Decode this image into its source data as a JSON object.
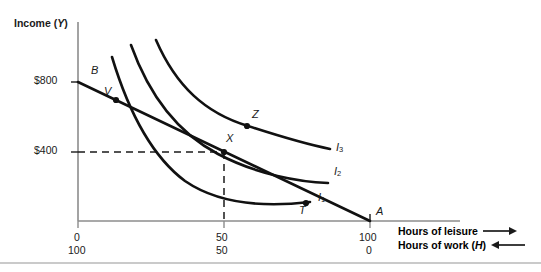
{
  "figure": {
    "y_axis_title": "Income (Y)",
    "x_axis_titles": {
      "leisure": "Hours of leisure",
      "work": "Hours of work (H)",
      "leisure_arrow": "right-arrow",
      "work_arrow": "left-arrow"
    },
    "y_ticks": [
      {
        "label": "$800",
        "value": 800
      },
      {
        "label": "$400",
        "value": 400
      }
    ],
    "x_ticks_leisure": [
      {
        "label": "0",
        "value": 0
      },
      {
        "label": "50",
        "value": 50
      },
      {
        "label": "100",
        "value": 100
      }
    ],
    "x_ticks_work": [
      {
        "label": "100",
        "value": 100
      },
      {
        "label": "50",
        "value": 50
      },
      {
        "label": "0",
        "value": 0
      }
    ],
    "point_labels": {
      "B": "B",
      "V": "V",
      "X": "X",
      "Z": "Z",
      "T": "T",
      "A": "A"
    },
    "curve_labels": {
      "i1": "I",
      "i1_sub": "1",
      "i2": "I",
      "i2_sub": "2",
      "i3": "I",
      "i3_sub": "3"
    },
    "colors": {
      "ink": "#1a1a1a",
      "axis": "#8c8c8c",
      "curve": "#111111",
      "dashed": "#1a1a1a",
      "rule": "#b8b8b8"
    }
  },
  "chart_data": {
    "type": "line",
    "title": "",
    "xlabel": "Hours of leisure / Hours of work (H)",
    "ylabel": "Income (Y)",
    "xlim": [
      0,
      110
    ],
    "ylim": [
      0,
      1000
    ],
    "grid": false,
    "legend": "inline-right",
    "x_dual_axis": {
      "top_row_name": "Hours of leisure",
      "top_row_ticks": [
        0,
        50,
        100
      ],
      "bottom_row_name": "Hours of work (H)",
      "bottom_row_ticks": [
        100,
        50,
        0
      ]
    },
    "y_ticks": [
      400,
      800
    ],
    "series": [
      {
        "name": "Budget constraint BA",
        "type": "line",
        "endpoints": [
          {
            "x": 0,
            "y": 800,
            "label": "B"
          },
          {
            "x": 100,
            "y": 0,
            "label": "A"
          }
        ]
      },
      {
        "name": "I1",
        "type": "indifference-curve",
        "label": "I1"
      },
      {
        "name": "I2",
        "type": "indifference-curve",
        "label": "I2"
      },
      {
        "name": "I3",
        "type": "indifference-curve",
        "label": "I3"
      }
    ],
    "annotated_points": [
      {
        "label": "B",
        "x": 0,
        "y": 800,
        "note": "budget line income intercept"
      },
      {
        "label": "V",
        "x": 13,
        "y": 690,
        "note": "budget line crosses I1"
      },
      {
        "label": "X",
        "x": 50,
        "y": 400,
        "note": "tangency of budget line with I2"
      },
      {
        "label": "Z",
        "x": 57,
        "y": 470,
        "note": "point on I3"
      },
      {
        "label": "T",
        "x": 85,
        "y": 120,
        "note": "budget line crosses I1"
      },
      {
        "label": "A",
        "x": 100,
        "y": 0,
        "note": "budget line leisure intercept"
      }
    ]
  }
}
